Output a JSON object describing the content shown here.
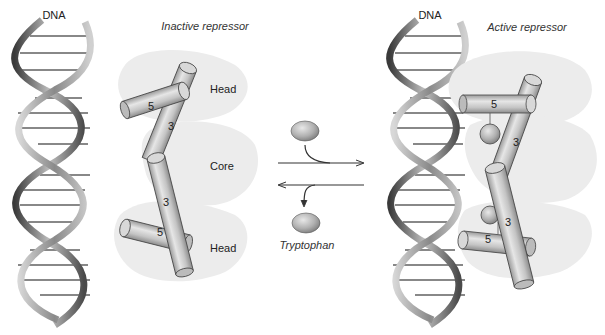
{
  "left": {
    "dna_label": "DNA",
    "title": "Inactive repressor",
    "domain_labels": {
      "head_top": "Head",
      "core": "Core",
      "head_bottom": "Head"
    },
    "helix_labels": {
      "top_helix5": "5",
      "top_helix3": "3",
      "bottom_helix3": "3",
      "bottom_helix5": "5"
    }
  },
  "center": {
    "ligand_label": "Tryptophan",
    "forward_arrow": "binding",
    "reverse_arrow": "release"
  },
  "right": {
    "dna_label": "DNA",
    "title": "Active repressor",
    "helix_labels": {
      "top_helix5": "5",
      "top_helix3": "3",
      "bottom_helix3": "3",
      "bottom_helix5": "5"
    }
  },
  "colors": {
    "blob": "#ececec",
    "cylinder": "#c8c8c8",
    "cylinder_dark": "#8a8a8a",
    "ligand": "#b5b5b5",
    "line": "#333333"
  }
}
